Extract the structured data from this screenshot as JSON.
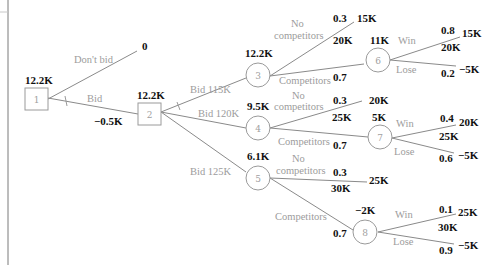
{
  "diagram": {
    "type": "decision-tree",
    "colors": {
      "edge": "#8a8a8a",
      "node_outline": "#9a9a9a",
      "label": "#9c9c9c",
      "value": "#111111"
    },
    "nodes": {
      "n1": {
        "id": "1",
        "shape": "square",
        "value": "12.2K"
      },
      "n2": {
        "id": "2",
        "shape": "square",
        "value": "12.2K"
      },
      "n3": {
        "id": "3",
        "shape": "circle",
        "value": "12.2K"
      },
      "n4": {
        "id": "4",
        "shape": "circle",
        "value": "9.5K"
      },
      "n5": {
        "id": "5",
        "shape": "circle",
        "value": "6.1K"
      },
      "n6": {
        "id": "6",
        "shape": "circle",
        "value": "11K"
      },
      "n7": {
        "id": "7",
        "shape": "circle",
        "value": "5K"
      },
      "n8": {
        "id": "8",
        "shape": "circle",
        "value": "−2K"
      }
    },
    "branches": {
      "dont_bid": {
        "label": "Don't bid",
        "payoff": "0"
      },
      "bid": {
        "label": "Bid",
        "cost": "−0.5K"
      },
      "bid115": {
        "label": "Bid 115K"
      },
      "bid120": {
        "label": "Bid 120K"
      },
      "bid125": {
        "label": "Bid 125K"
      },
      "n3_nocomp": {
        "label_line1": "No",
        "label_line2": "competitors",
        "prob": "0.3",
        "cash": "20K",
        "payoff": "15K"
      },
      "n3_comp": {
        "label": "Competitors",
        "prob": "0.7"
      },
      "n4_nocomp": {
        "label_line1": "No",
        "label_line2": "competitors",
        "prob": "0.3",
        "cash": "25K",
        "payoff": "20K"
      },
      "n4_comp": {
        "label": "Competitors",
        "prob": "0.7"
      },
      "n5_nocomp": {
        "label_line1": "No",
        "label_line2": "competitors",
        "prob": "0.3",
        "cash": "30K",
        "payoff": "25K"
      },
      "n5_comp": {
        "label": "Competitors",
        "prob": "0.7"
      },
      "n6_win": {
        "label": "Win",
        "prob": "0.8",
        "cash": "20K",
        "payoff": "15K"
      },
      "n6_lose": {
        "label": "Lose",
        "prob": "0.2",
        "payoff": "−5K"
      },
      "n7_win": {
        "label": "Win",
        "prob": "0.4",
        "cash": "25K",
        "payoff": "20K"
      },
      "n7_lose": {
        "label": "Lose",
        "prob": "0.6",
        "payoff": "−5K"
      },
      "n8_win": {
        "label": "Win",
        "prob": "0.1",
        "cash": "30K",
        "payoff": "25K"
      },
      "n8_lose": {
        "label": "Lose",
        "prob": "0.9",
        "payoff": "−5K"
      }
    }
  }
}
